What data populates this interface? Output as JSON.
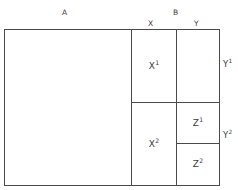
{
  "diagram": {
    "title_labels": {
      "a": "A",
      "b": "B",
      "x": "X",
      "y": "Y"
    },
    "cells": [
      {
        "id": "x1",
        "base": "X",
        "exp": "1"
      },
      {
        "id": "x2",
        "base": "X",
        "exp": "2"
      },
      {
        "id": "z1",
        "base": "Z",
        "exp": "1"
      },
      {
        "id": "z2",
        "base": "Z",
        "exp": "2"
      }
    ],
    "side_labels": [
      {
        "id": "y1",
        "base": "Y",
        "exp": "1"
      },
      {
        "id": "y2",
        "base": "Y",
        "exp": "2"
      }
    ],
    "colors": {
      "stroke": "#4a4a4a",
      "text": "#3d3d3d",
      "background": "#ffffff"
    }
  }
}
